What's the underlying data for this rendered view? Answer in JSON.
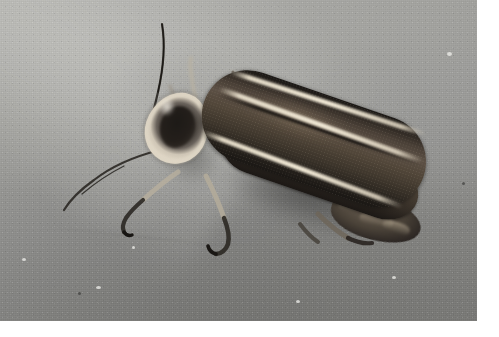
{
  "image": {
    "subject": "firefly",
    "common_name": "Firefly (lightning bug)",
    "scientific_name": "Photinus sp.",
    "alt_text": "Close-up photograph of a firefly beetle resting on a gray concrete surface",
    "orientation": "horizontal",
    "width_px": 499,
    "height_px": 337,
    "photo_width_px": 477,
    "photo_height_px": 321,
    "color_mode": "desaturated color",
    "background_surface": "weathered gray concrete"
  },
  "palette": {
    "concrete_light": "#a2a29e",
    "concrete_mid": "#929290",
    "concrete_dark": "#7e7e7b",
    "elytra_dark": "#1b1815",
    "elytra_mid": "#5c5045",
    "pale_stripe": "#eee6d3",
    "pronotum_rim": "#ded5c4",
    "pronotum_center": "#241f1b",
    "shadow": "#2d2d2c",
    "margin": "#ffffff"
  },
  "subject_parts": [
    {
      "id": "antenna-left",
      "label": "Antenna (upper left)"
    },
    {
      "id": "antenna-lower",
      "label": "Antenna (lower left)"
    },
    {
      "id": "pronotum",
      "label": "Pronotum (head shield)"
    },
    {
      "id": "elytra",
      "label": "Elytra (wing covers)"
    },
    {
      "id": "suture-stripe",
      "label": "Pale elytral suture stripe"
    },
    {
      "id": "margin-stripe",
      "label": "Pale elytral margin stripe"
    },
    {
      "id": "foreleg",
      "label": "Foreleg"
    },
    {
      "id": "midleg",
      "label": "Middle leg"
    },
    {
      "id": "hindleg",
      "label": "Hind leg"
    },
    {
      "id": "abdomen",
      "label": "Abdomen tip"
    }
  ],
  "composition": {
    "subject_position": "center, angled from upper-left to lower-right",
    "body_angle_deg": 19,
    "lighting": "diffuse daylight from upper left",
    "shadow_direction": "lower right"
  }
}
